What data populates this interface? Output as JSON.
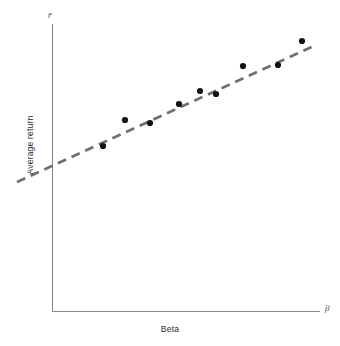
{
  "figure": {
    "background_color": "#ffffff",
    "width": 340,
    "height": 346
  },
  "axes": {
    "y_symbol": "r̄",
    "x_symbol": "β",
    "y_title": "Average return",
    "x_title": "Beta",
    "axis_color": "#8a8a8a",
    "origin": {
      "x": 52,
      "y": 311
    },
    "y_axis_top": {
      "x": 52,
      "y": 24
    },
    "x_axis_right": {
      "x": 320,
      "y": 311
    }
  },
  "chart_data": {
    "type": "scatter",
    "title": "",
    "subtitle": "",
    "xlabel": "Beta",
    "ylabel": "Average return",
    "xlim": [
      0,
      1
    ],
    "ylim": [
      0,
      1
    ],
    "grid": false,
    "legend": null,
    "annotations": [],
    "point_color": "#121212",
    "point_radius_px": 3.1,
    "series": [
      {
        "name": "Securities",
        "points_px": [
          {
            "x": 103,
            "y": 146
          },
          {
            "x": 125,
            "y": 120
          },
          {
            "x": 150,
            "y": 123
          },
          {
            "x": 179,
            "y": 104
          },
          {
            "x": 200,
            "y": 91
          },
          {
            "x": 216,
            "y": 94
          },
          {
            "x": 243,
            "y": 66
          },
          {
            "x": 278,
            "y": 65
          },
          {
            "x": 302,
            "y": 41
          }
        ]
      }
    ],
    "fit_line": {
      "name": "Security market line (fitted)",
      "style": "dashed",
      "color": "#6e6e74",
      "dash_pattern": "9 6",
      "width_px": 2.6,
      "start_px": {
        "x": 17,
        "y": 182
      },
      "end_px": {
        "x": 316,
        "y": 45
      }
    }
  }
}
